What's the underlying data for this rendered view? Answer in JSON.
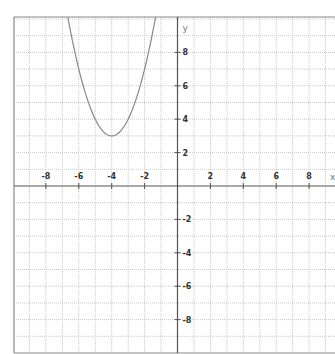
{
  "chart_data": {
    "type": "line",
    "title": "",
    "xlabel": "x",
    "ylabel": "y",
    "function": "y = (x + 4)^2 + 3",
    "vertex": [
      -4,
      3
    ],
    "xlim": [
      -9.9,
      9.55
    ],
    "ylim": [
      -10.0,
      10.1
    ],
    "grid": true,
    "grid_step": 1,
    "x_ticks": [
      -8,
      -6,
      -4,
      -2,
      2,
      4,
      6,
      8
    ],
    "y_ticks": [
      8,
      6,
      4,
      2,
      -2,
      -4,
      -6,
      -8
    ],
    "x_tick_labels": [
      "-8",
      "-6",
      "-4",
      "-2",
      "2",
      "4",
      "6",
      "8"
    ],
    "y_tick_labels": [
      "8",
      "6",
      "4",
      "2",
      "-2",
      "-4",
      "-6",
      "-8"
    ],
    "series": [
      {
        "name": "parabola",
        "x": [
          -6.65,
          -6.5,
          -6,
          -5.5,
          -5,
          -4.5,
          -4,
          -3.5,
          -3,
          -2.5,
          -2,
          -1.5,
          -1.35
        ],
        "y": [
          10.02,
          9.25,
          7,
          5.25,
          4,
          3.25,
          3,
          3.25,
          4,
          5.25,
          7,
          9.25,
          10.02
        ]
      }
    ],
    "legend": null
  },
  "colors": {
    "axis": "#555555",
    "frame": "#888888",
    "grid": "#c8c8c8",
    "curve": "#888888",
    "tick_text": "#333333"
  }
}
